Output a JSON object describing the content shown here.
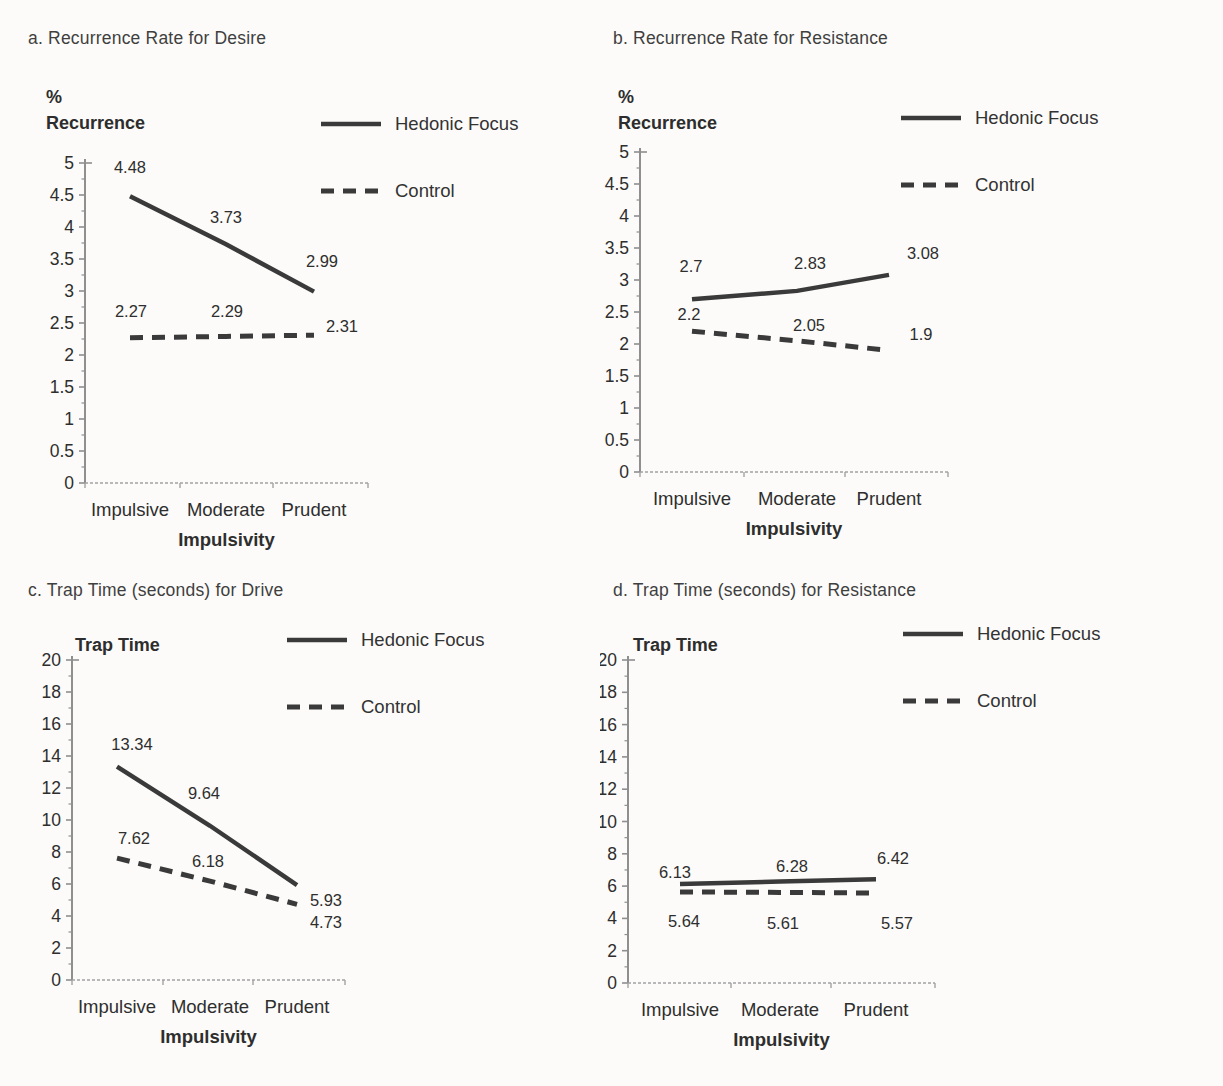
{
  "page": {
    "background": "#fcfbf9",
    "ink": "#3a3a3a",
    "axis_color": "#8f8f8f",
    "figure_type": "2x2 line chart grid"
  },
  "legend": {
    "items": [
      {
        "label": "Hedonic Focus",
        "style": "solid"
      },
      {
        "label": "Control",
        "style": "dashed"
      }
    ],
    "position": "top-right"
  },
  "chart_data": [
    {
      "id": "a",
      "type": "line",
      "title": "a. Recurrence Rate for Desire",
      "ylabel_lines": [
        "%",
        "Recurrence"
      ],
      "xlabel": "Impulsivity",
      "categories": [
        "Impulsive",
        "Moderate",
        "Prudent"
      ],
      "ylim": [
        0,
        5
      ],
      "yticks": [
        0,
        0.5,
        1,
        1.5,
        2,
        2.5,
        3,
        3.5,
        4,
        4.5,
        5
      ],
      "grid": false,
      "legend_position": "top-right",
      "series": [
        {
          "name": "Hedonic Focus",
          "style": "solid",
          "values": [
            4.48,
            3.73,
            2.99
          ],
          "label_offsets": [
            [
              0,
              -23
            ],
            [
              0,
              -21
            ],
            [
              8,
              -25
            ]
          ]
        },
        {
          "name": "Control",
          "style": "dashed",
          "values": [
            2.27,
            2.29,
            2.31
          ],
          "label_offsets": [
            [
              1,
              -21
            ],
            [
              1,
              -19
            ],
            [
              28,
              -3
            ]
          ]
        }
      ]
    },
    {
      "id": "b",
      "type": "line",
      "title": "b. Recurrence Rate for Resistance",
      "ylabel_lines": [
        "%",
        "Recurrence"
      ],
      "xlabel": "Impulsivity",
      "categories": [
        "Impulsive",
        "Moderate",
        "Prudent"
      ],
      "ylim": [
        0,
        5
      ],
      "yticks": [
        0,
        0.5,
        1,
        1.5,
        2,
        2.5,
        3,
        3.5,
        4,
        4.5,
        5
      ],
      "grid": false,
      "legend_position": "top-right",
      "series": [
        {
          "name": "Hedonic Focus",
          "style": "solid",
          "values": [
            2.7,
            2.83,
            3.08
          ],
          "label_offsets": [
            [
              -1,
              -27
            ],
            [
              13,
              -22
            ],
            [
              34,
              -16
            ]
          ]
        },
        {
          "name": "Control",
          "style": "dashed",
          "values": [
            2.2,
            2.05,
            1.9
          ],
          "label_offsets": [
            [
              -3,
              -11
            ],
            [
              12,
              -10
            ],
            [
              32,
              -10
            ]
          ]
        }
      ]
    },
    {
      "id": "c",
      "type": "line",
      "title": "c. Trap Time (seconds) for Drive",
      "ylabel_lines": [
        "Trap Time"
      ],
      "xlabel": "Impulsivity",
      "categories": [
        "Impulsive",
        "Moderate",
        "Prudent"
      ],
      "ylim": [
        0,
        20
      ],
      "yticks": [
        0,
        2,
        4,
        6,
        8,
        10,
        12,
        14,
        16,
        18,
        20
      ],
      "grid": false,
      "legend_position": "top-right",
      "series": [
        {
          "name": "Hedonic Focus",
          "style": "solid",
          "values": [
            13.34,
            9.64,
            5.93
          ],
          "label_offsets": [
            [
              15,
              -17
            ],
            [
              -6,
              -27
            ],
            [
              29,
              21
            ]
          ]
        },
        {
          "name": "Control",
          "style": "dashed",
          "values": [
            7.62,
            6.18,
            4.73
          ],
          "label_offsets": [
            [
              17,
              -14
            ],
            [
              -2,
              -14
            ],
            [
              29,
              24
            ]
          ]
        }
      ]
    },
    {
      "id": "d",
      "type": "line",
      "title": "d. Trap Time (seconds) for Resistance",
      "ylabel_lines": [
        "Trap Time"
      ],
      "xlabel": "Impulsivity",
      "categories": [
        "Impulsive",
        "Moderate",
        "Prudent"
      ],
      "ylim": [
        0,
        20
      ],
      "yticks": [
        0,
        2,
        4,
        6,
        8,
        10,
        12,
        14,
        16,
        18,
        20
      ],
      "grid": false,
      "legend_position": "top-right",
      "series": [
        {
          "name": "Hedonic Focus",
          "style": "solid",
          "values": [
            6.13,
            6.28,
            6.42
          ],
          "label_offsets": [
            [
              -5,
              -6
            ],
            [
              12,
              -10
            ],
            [
              17,
              -15
            ]
          ]
        },
        {
          "name": "Control",
          "style": "dashed",
          "values": [
            5.64,
            5.61,
            5.57
          ],
          "label_offsets": [
            [
              4,
              35
            ],
            [
              3,
              37
            ],
            [
              21,
              36
            ]
          ]
        }
      ]
    }
  ]
}
